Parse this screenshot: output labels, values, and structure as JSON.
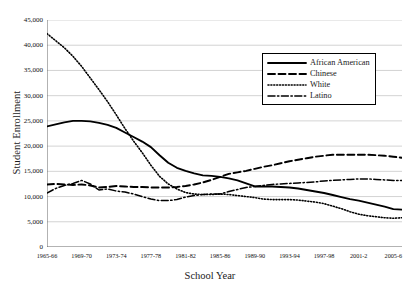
{
  "chart_data": {
    "type": "line",
    "title": "",
    "xlabel": "School Year",
    "ylabel": "Student Enrollment",
    "ylim": [
      0,
      45000
    ],
    "ytick_values": [
      0,
      5000,
      10000,
      15000,
      20000,
      25000,
      30000,
      35000,
      40000,
      45000
    ],
    "ytick_labels": [
      "0",
      "5,000",
      "10,000",
      "15,000",
      "20,000",
      "25,000",
      "30,000",
      "35,000",
      "40,000",
      "45,000"
    ],
    "grid": true,
    "legend_position": "upper right",
    "x": [
      "1965-66",
      "1966-67",
      "1967-68",
      "1968-69",
      "1969-70",
      "1970-71",
      "1971-72",
      "1972-73",
      "1973-74",
      "1974-75",
      "1975-76",
      "1976-77",
      "1977-78",
      "1978-79",
      "1979-80",
      "1980-81",
      "1981-82",
      "1982-83",
      "1983-84",
      "1984-85",
      "1985-86",
      "1986-87",
      "1987-88",
      "1988-89",
      "1989-90",
      "1990-91",
      "1991-92",
      "1992-93",
      "1993-94",
      "1994-95",
      "1995-96",
      "1996-97",
      "1997-98",
      "1998-99",
      "1999-2000",
      "2000-1",
      "2001-2",
      "2002-3",
      "2003-4",
      "2004-5",
      "2005-6",
      "2006-7"
    ],
    "xtick_labels": [
      "1965-66",
      "1969-70",
      "1973-74",
      "1977-78",
      "1981-82",
      "1985-86",
      "1989-90",
      "1993-94",
      "1997-98",
      "2001-2",
      "2005-6"
    ],
    "xtick_indices": [
      0,
      4,
      8,
      12,
      16,
      20,
      24,
      28,
      32,
      36,
      40
    ],
    "series": [
      {
        "name": "African American",
        "style": "solid",
        "color": "#000000",
        "values": [
          23900,
          24300,
          24700,
          25000,
          25000,
          24900,
          24600,
          24200,
          23600,
          22700,
          21800,
          20900,
          19800,
          18200,
          16700,
          15700,
          15100,
          14600,
          14200,
          14100,
          13900,
          13600,
          13200,
          12600,
          12000,
          12000,
          12000,
          11900,
          11800,
          11600,
          11300,
          11000,
          10700,
          10300,
          9900,
          9500,
          9200,
          8800,
          8400,
          8000,
          7500,
          7400
        ]
      },
      {
        "name": "Chinese",
        "style": "dashed",
        "color": "#000000",
        "values": [
          12400,
          12500,
          12400,
          12300,
          12400,
          12200,
          11800,
          11900,
          12100,
          12000,
          11900,
          11900,
          11800,
          11800,
          11800,
          11900,
          12100,
          12400,
          12800,
          13300,
          13900,
          14500,
          14800,
          15100,
          15500,
          15900,
          16200,
          16600,
          17000,
          17300,
          17600,
          17900,
          18100,
          18300,
          18300,
          18300,
          18300,
          18300,
          18200,
          18100,
          17900,
          17700
        ]
      },
      {
        "name": "White",
        "style": "dotted",
        "color": "#000000",
        "values": [
          42300,
          40900,
          39500,
          37800,
          35800,
          33500,
          31200,
          28800,
          26200,
          23500,
          21000,
          18700,
          16200,
          14000,
          12500,
          11500,
          10800,
          10500,
          10400,
          10400,
          10500,
          10400,
          10200,
          10000,
          9800,
          9500,
          9400,
          9400,
          9400,
          9300,
          9100,
          8900,
          8600,
          8100,
          7600,
          7000,
          6500,
          6200,
          6000,
          5800,
          5700,
          5800
        ]
      },
      {
        "name": "Latino",
        "style": "dashdot",
        "color": "#000000",
        "values": [
          10700,
          11600,
          12200,
          12600,
          13200,
          12500,
          11300,
          11500,
          11100,
          10900,
          10500,
          10000,
          9500,
          9200,
          9200,
          9400,
          9900,
          10200,
          10400,
          10500,
          10500,
          11000,
          11400,
          11800,
          12000,
          12200,
          12400,
          12500,
          12600,
          12700,
          12800,
          12900,
          13100,
          13200,
          13300,
          13400,
          13500,
          13500,
          13400,
          13300,
          13200,
          13200
        ]
      }
    ]
  },
  "legend": {
    "items": [
      {
        "label": "African American"
      },
      {
        "label": "Chinese"
      },
      {
        "label": "White"
      },
      {
        "label": "Latino"
      }
    ]
  }
}
